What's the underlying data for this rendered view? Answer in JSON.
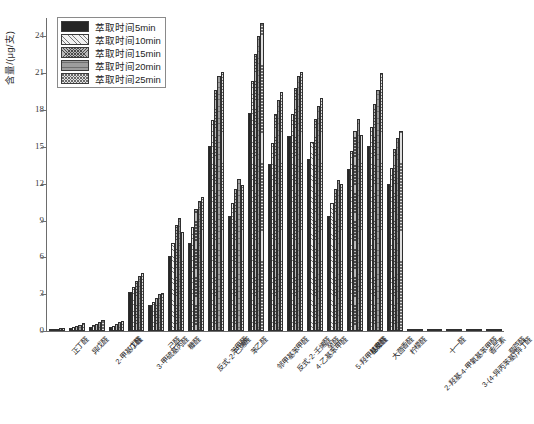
{
  "chart_data": {
    "type": "bar",
    "title": "",
    "xlabel": "",
    "ylabel": "含量/(μg/支)",
    "ylim": [
      0,
      25.5
    ],
    "yticks": [
      0,
      3,
      6,
      9,
      12,
      15,
      18,
      21,
      24
    ],
    "ytick_labels": [
      "0",
      "3",
      "6",
      "9",
      "12",
      "15",
      "18",
      "21",
      "24"
    ],
    "grid": false,
    "legend_position": "upper-left",
    "categories": [
      "正丁醛",
      "异戊醛",
      "2-甲基丁醛",
      "戊醛",
      "3-甲硫基丙醛",
      "己醛",
      "糠醛",
      "反式-2-己烯醛",
      "苯甲醛",
      "苯乙醛",
      "邻甲基苯甲醛",
      "反式-2-壬烯醛",
      "4-乙基苯甲醛",
      "癸醛",
      "5-羟甲基糠醛",
      "桂皮醛",
      "大茴香醛",
      "柠檬醛",
      "2-羟基-4-甲氧基苯甲醛",
      "十一醛",
      "3-(4-异丙苯基)异丁醛",
      "香兰素",
      "藜芦醛"
    ],
    "series": [
      {
        "name": "萃取时间5min",
        "fill": "solid-black",
        "values": [
          0.1,
          0.25,
          0.35,
          0.3,
          3.2,
          2.1,
          6.1,
          7.2,
          15.1,
          9.4,
          17.8,
          13.6,
          15.9,
          14.0,
          9.4,
          13.2,
          15.1,
          12.0,
          0.0,
          0.0,
          0.0,
          0.0,
          0.0
        ]
      },
      {
        "name": "萃取时间10min",
        "fill": "light-diagonal-hatch",
        "values": [
          0.14,
          0.33,
          0.45,
          0.42,
          3.6,
          2.35,
          7.2,
          8.5,
          17.2,
          10.4,
          20.4,
          15.3,
          17.7,
          15.4,
          10.4,
          14.7,
          16.6,
          13.3,
          0.0,
          0.0,
          0.0,
          0.0,
          0.0
        ]
      },
      {
        "name": "萃取时间15min",
        "fill": "cross-hatch-dark",
        "values": [
          0.18,
          0.42,
          0.6,
          0.55,
          4.1,
          2.7,
          8.6,
          9.9,
          19.6,
          11.6,
          22.6,
          17.7,
          19.8,
          17.3,
          11.6,
          16.3,
          18.5,
          14.8,
          0.0,
          0.0,
          0.0,
          0.0,
          0.0
        ]
      },
      {
        "name": "萃取时间20min",
        "fill": "horizontal-hatch-gray",
        "values": [
          0.22,
          0.52,
          0.74,
          0.7,
          4.5,
          3.0,
          9.2,
          10.6,
          20.8,
          12.4,
          24.0,
          18.8,
          20.8,
          18.3,
          12.3,
          17.3,
          19.6,
          15.7,
          0.0,
          0.0,
          0.0,
          0.0,
          0.0
        ]
      },
      {
        "name": "萃取时间25min",
        "fill": "fine-cross-hatch",
        "values": [
          0.26,
          0.62,
          0.88,
          0.84,
          4.75,
          3.1,
          8.1,
          10.9,
          21.1,
          11.9,
          25.1,
          19.5,
          21.1,
          19.0,
          12.0,
          16.0,
          21.0,
          16.3,
          0.0,
          0.0,
          0.0,
          0.0,
          0.0
        ]
      }
    ]
  },
  "legend": {
    "items": [
      {
        "label": "萃取时间5min",
        "swatch": "f0"
      },
      {
        "label": "萃取时间10min",
        "swatch": "f1"
      },
      {
        "label": "萃取时间15min",
        "swatch": "f2"
      },
      {
        "label": "萃取时间20min",
        "swatch": "f3"
      },
      {
        "label": "萃取时间25min",
        "swatch": "f4"
      }
    ]
  },
  "axes": {
    "y_title": "含量/(μg/支)"
  }
}
